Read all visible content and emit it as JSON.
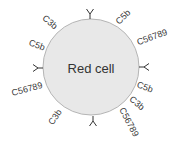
{
  "diagram": {
    "cell": {
      "label": "Red cell",
      "cx": 91,
      "cy": 67,
      "r": 48,
      "fill": "#e8e8e8",
      "stroke": "#b5b5b5"
    },
    "antibodies": [
      {
        "name": "top",
        "x": 90,
        "y": 19,
        "angle": 0
      },
      {
        "name": "right",
        "x": 139,
        "y": 67,
        "angle": 90
      },
      {
        "name": "bottom",
        "x": 93,
        "y": 116,
        "angle": 180
      },
      {
        "name": "left",
        "x": 43,
        "y": 68,
        "angle": 270
      }
    ],
    "labels": [
      {
        "text": "C3b",
        "x": 50,
        "y": 22,
        "angle": 40
      },
      {
        "text": "C5b",
        "x": 37,
        "y": 45,
        "angle": 20
      },
      {
        "text": "C56789",
        "x": 27,
        "y": 89,
        "angle": -15
      },
      {
        "text": "C3b",
        "x": 55,
        "y": 117,
        "angle": -55
      },
      {
        "text": "C5b",
        "x": 123,
        "y": 17,
        "angle": -45
      },
      {
        "text": "C56789",
        "x": 152,
        "y": 37,
        "angle": -20
      },
      {
        "text": "C5b",
        "x": 145,
        "y": 87,
        "angle": 20
      },
      {
        "text": "C3b",
        "x": 137,
        "y": 103,
        "angle": 40
      },
      {
        "text": "C56789",
        "x": 129,
        "y": 122,
        "angle": 62
      }
    ]
  }
}
